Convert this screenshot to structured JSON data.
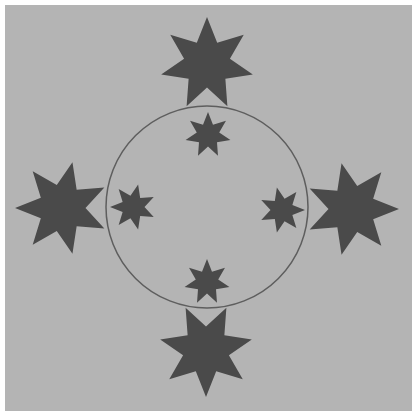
{
  "figure": {
    "background_color": "#b4b4b4",
    "star_color": "#4a4a4a",
    "circle_stroke": "#5e5e5e",
    "circle": {
      "cx": 207,
      "cy": 207,
      "r": 101
    },
    "star_points": 7,
    "large_stars": [
      {
        "id": "top",
        "cx": 207,
        "cy": 64,
        "r": 47,
        "rotation": 0
      },
      {
        "id": "left",
        "cx": 62,
        "cy": 208,
        "r": 47,
        "rotation": -90
      },
      {
        "id": "right",
        "cx": 352,
        "cy": 209,
        "r": 47,
        "rotation": 90
      },
      {
        "id": "bottom",
        "cx": 206,
        "cy": 350,
        "r": 47,
        "rotation": 180
      }
    ],
    "small_stars": [
      {
        "id": "top",
        "cx": 208,
        "cy": 135,
        "r": 23,
        "rotation": 0
      },
      {
        "id": "left",
        "cx": 133,
        "cy": 207,
        "r": 23,
        "rotation": -90
      },
      {
        "id": "right",
        "cx": 282,
        "cy": 210,
        "r": 23,
        "rotation": 90
      },
      {
        "id": "bottom",
        "cx": 207,
        "cy": 282,
        "r": 23,
        "rotation": 0
      }
    ]
  }
}
